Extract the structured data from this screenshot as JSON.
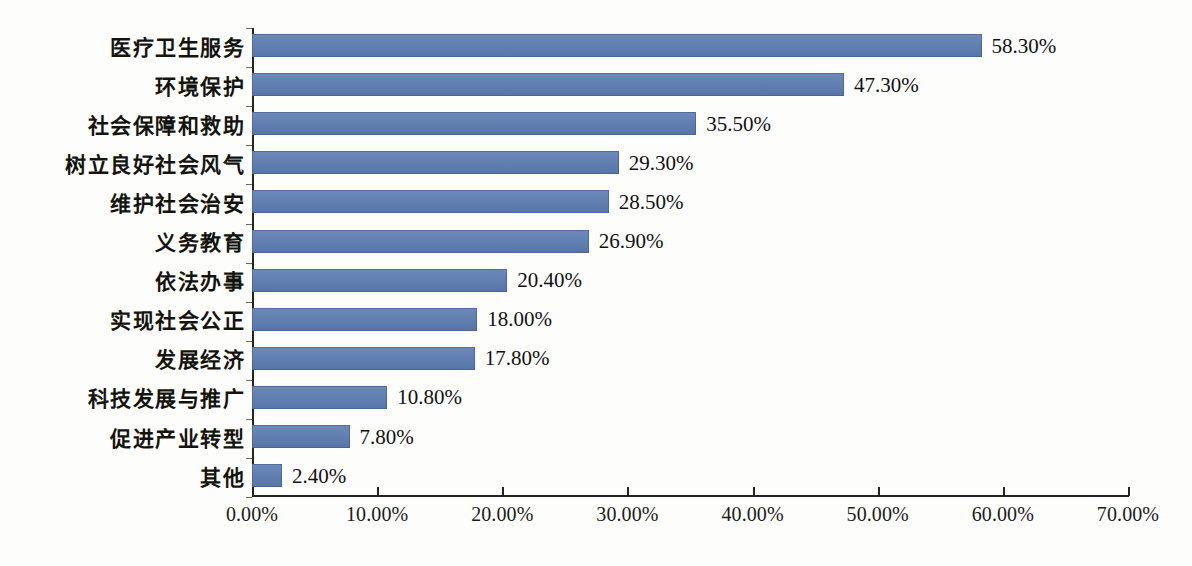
{
  "chart_data": {
    "type": "bar",
    "orientation": "horizontal",
    "title": "",
    "subtitle": "",
    "xlabel": "",
    "ylabel": "",
    "xlim": [
      0,
      70
    ],
    "ylim": null,
    "grid": false,
    "legend": null,
    "legend_position": "none",
    "bar_color": "#5c7cb2",
    "axis_color": "#23231f",
    "text_color": "#14140f",
    "background": "#fdfdfc",
    "value_suffix": "%",
    "categories": [
      "医疗卫生服务",
      "环境保护",
      "社会保障和救助",
      "树立良好社会风气",
      "维护社会治安",
      "义务教育",
      "依法办事",
      "实现社会公正",
      "发展经济",
      "科技发展与推广",
      "促进产业转型",
      "其他"
    ],
    "values": [
      58.3,
      47.3,
      35.5,
      29.3,
      28.5,
      26.9,
      20.4,
      18.0,
      17.8,
      10.8,
      7.8,
      2.4
    ],
    "value_labels": [
      "58.30%",
      "47.30%",
      "35.50%",
      "29.30%",
      "28.50%",
      "26.90%",
      "20.40%",
      "18.00%",
      "17.80%",
      "10.80%",
      "7.80%",
      "2.40%"
    ],
    "xticks": [
      0,
      10,
      20,
      30,
      40,
      50,
      60,
      70
    ],
    "xtick_labels": [
      "0.00%",
      "10.00%",
      "20.00%",
      "30.00%",
      "40.00%",
      "50.00%",
      "60.00%",
      "70.00%"
    ]
  }
}
